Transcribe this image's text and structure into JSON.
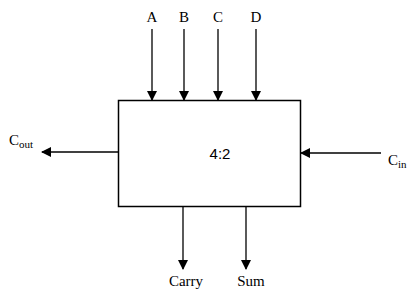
{
  "diagram": {
    "block_label": "4:2",
    "inputs_top": [
      "A",
      "B",
      "C",
      "D"
    ],
    "input_right": {
      "base": "C",
      "sub": "in"
    },
    "output_left": {
      "base": "C",
      "sub": "out"
    },
    "outputs_bottom": [
      "Carry",
      "Sum"
    ]
  }
}
